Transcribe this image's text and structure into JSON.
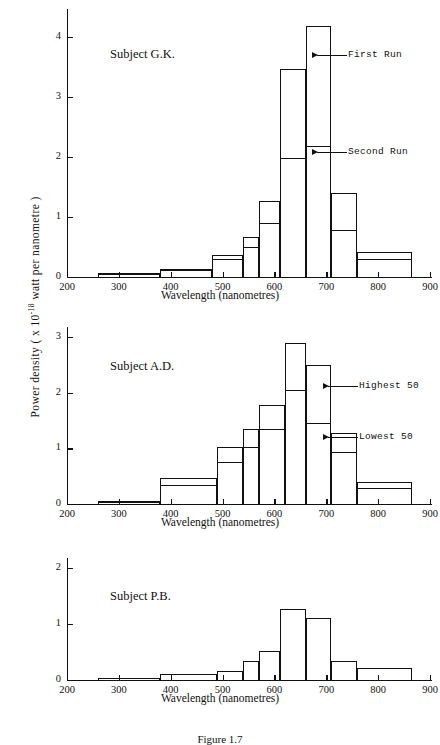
{
  "figure": {
    "y_axis_label": "Power density  ( x 10",
    "y_axis_label_exp": "-18",
    "y_axis_label_tail": " watt per nanometre )",
    "x_axis_title": "Wavelength (nanometres)",
    "caption": "Figure 1.7"
  },
  "panels": [
    {
      "id": "panel-gk",
      "subject": "Subject G.K.",
      "annotations": [
        {
          "name": "first-run",
          "label": "First Run"
        },
        {
          "name": "second-run",
          "label": "Second Run"
        }
      ],
      "x_ticks": [
        "200",
        "300",
        "400",
        "500",
        "600",
        "700",
        "800",
        "900"
      ],
      "y_ticks": [
        "0",
        "1",
        "2",
        "3",
        "4"
      ]
    },
    {
      "id": "panel-ad",
      "subject": "Subject A.D.",
      "annotations": [
        {
          "name": "highest-50",
          "label": "Highest 50"
        },
        {
          "name": "lowest-50",
          "label": "Lowest 50"
        }
      ],
      "x_ticks": [
        "200",
        "300",
        "400",
        "500",
        "600",
        "700",
        "800",
        "900"
      ],
      "y_ticks": [
        "0",
        "1",
        "2",
        "3"
      ]
    },
    {
      "id": "panel-pb",
      "subject": "Subject P.B.",
      "annotations": [],
      "x_ticks": [
        "200",
        "300",
        "400",
        "500",
        "600",
        "700",
        "800",
        "900"
      ],
      "y_ticks": [
        "0",
        "1",
        "2"
      ]
    }
  ],
  "chart_data": [
    {
      "type": "bar",
      "title": "Subject G.K.",
      "xlabel": "Wavelength (nanometres)",
      "ylabel": "Power density ( x 10^-18 watt per nanometre )",
      "xlim": [
        200,
        900
      ],
      "ylim": [
        0,
        4.4
      ],
      "grid": false,
      "legend_position": "inline-arrow-annotations",
      "bin_edges": [
        260,
        310,
        380,
        430,
        480,
        540,
        570,
        610,
        660,
        710,
        760,
        810,
        865
      ],
      "series": [
        {
          "name": "First Run",
          "bins": [
            {
              "x0": 260,
              "x1": 380,
              "value": 0.07
            },
            {
              "x0": 380,
              "x1": 480,
              "value": 0.13
            },
            {
              "x0": 480,
              "x1": 540,
              "value": 0.36
            },
            {
              "x0": 540,
              "x1": 570,
              "value": 0.67
            },
            {
              "x0": 570,
              "x1": 610,
              "value": 1.26
            },
            {
              "x0": 610,
              "x1": 660,
              "value": 3.46
            },
            {
              "x0": 660,
              "x1": 710,
              "value": 4.19
            },
            {
              "x0": 710,
              "x1": 760,
              "value": 1.4
            },
            {
              "x0": 760,
              "x1": 865,
              "value": 0.41
            }
          ]
        },
        {
          "name": "Second Run",
          "bins": [
            {
              "x0": 260,
              "x1": 380,
              "value": 0.05
            },
            {
              "x0": 380,
              "x1": 480,
              "value": 0.11
            },
            {
              "x0": 480,
              "x1": 540,
              "value": 0.3
            },
            {
              "x0": 540,
              "x1": 570,
              "value": 0.5
            },
            {
              "x0": 570,
              "x1": 610,
              "value": 0.9
            },
            {
              "x0": 610,
              "x1": 660,
              "value": 1.98
            },
            {
              "x0": 660,
              "x1": 710,
              "value": 2.18
            },
            {
              "x0": 710,
              "x1": 760,
              "value": 0.79
            },
            {
              "x0": 760,
              "x1": 865,
              "value": 0.3
            }
          ]
        }
      ]
    },
    {
      "type": "bar",
      "title": "Subject A.D.",
      "xlabel": "Wavelength (nanometres)",
      "ylabel": "Power density ( x 10^-18 watt per nanometre )",
      "xlim": [
        200,
        900
      ],
      "ylim": [
        0,
        3.1
      ],
      "grid": false,
      "legend_position": "inline-arrow-annotations",
      "bin_edges": [
        260,
        380,
        430,
        490,
        540,
        570,
        620,
        660,
        710,
        760,
        810,
        865
      ],
      "series": [
        {
          "name": "Highest 50",
          "bins": [
            {
              "x0": 260,
              "x1": 380,
              "value": 0.06
            },
            {
              "x0": 380,
              "x1": 490,
              "value": 0.47
            },
            {
              "x0": 490,
              "x1": 540,
              "value": 1.02
            },
            {
              "x0": 540,
              "x1": 570,
              "value": 1.35
            },
            {
              "x0": 570,
              "x1": 620,
              "value": 1.77
            },
            {
              "x0": 620,
              "x1": 660,
              "value": 2.89
            },
            {
              "x0": 660,
              "x1": 710,
              "value": 2.5
            },
            {
              "x0": 710,
              "x1": 760,
              "value": 1.27
            },
            {
              "x0": 760,
              "x1": 865,
              "value": 0.39
            }
          ]
        },
        {
          "name": "Lowest 50",
          "bins": [
            {
              "x0": 260,
              "x1": 380,
              "value": 0.04
            },
            {
              "x0": 380,
              "x1": 490,
              "value": 0.34
            },
            {
              "x0": 490,
              "x1": 540,
              "value": 0.76
            },
            {
              "x0": 540,
              "x1": 570,
              "value": 1.02
            },
            {
              "x0": 570,
              "x1": 620,
              "value": 1.35
            },
            {
              "x0": 620,
              "x1": 660,
              "value": 2.04
            },
            {
              "x0": 660,
              "x1": 710,
              "value": 1.45
            },
            {
              "x0": 710,
              "x1": 760,
              "value": 0.93
            },
            {
              "x0": 760,
              "x1": 865,
              "value": 0.29
            }
          ]
        }
      ]
    },
    {
      "type": "bar",
      "title": "Subject P.B.",
      "xlabel": "Wavelength (nanometres)",
      "ylabel": "Power density ( x 10^-18 watt per nanometre )",
      "xlim": [
        200,
        900
      ],
      "ylim": [
        0,
        2.1
      ],
      "grid": false,
      "legend_position": "none",
      "bin_edges": [
        260,
        380,
        430,
        490,
        540,
        570,
        610,
        660,
        710,
        760,
        810,
        865
      ],
      "series": [
        {
          "name": "Subject P.B.",
          "bins": [
            {
              "x0": 260,
              "x1": 380,
              "value": 0.03
            },
            {
              "x0": 380,
              "x1": 490,
              "value": 0.1
            },
            {
              "x0": 490,
              "x1": 540,
              "value": 0.16
            },
            {
              "x0": 540,
              "x1": 570,
              "value": 0.34
            },
            {
              "x0": 570,
              "x1": 610,
              "value": 0.52
            },
            {
              "x0": 610,
              "x1": 660,
              "value": 1.26
            },
            {
              "x0": 660,
              "x1": 710,
              "value": 1.11
            },
            {
              "x0": 710,
              "x1": 760,
              "value": 0.34
            },
            {
              "x0": 760,
              "x1": 865,
              "value": 0.22
            }
          ]
        }
      ]
    }
  ]
}
